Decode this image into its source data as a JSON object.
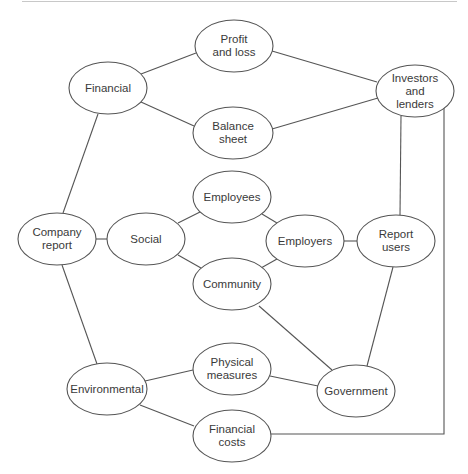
{
  "diagram": {
    "type": "concept-map",
    "colors": {
      "stroke": "#555555",
      "text": "#3a3a3a",
      "background": "#ffffff"
    },
    "nodes": [
      {
        "id": "financial",
        "label": "Financial",
        "cx": 108,
        "cy": 88,
        "rx": 39,
        "ry": 26
      },
      {
        "id": "profit-and-loss",
        "label": "Profit\nand loss",
        "cx": 234,
        "cy": 46,
        "rx": 39,
        "ry": 26
      },
      {
        "id": "balance-sheet",
        "label": "Balance\nsheet",
        "cx": 233,
        "cy": 133,
        "rx": 40,
        "ry": 26
      },
      {
        "id": "investors-and-lenders",
        "label": "Investors\nand\nlenders",
        "cx": 415,
        "cy": 91,
        "rx": 39,
        "ry": 26
      },
      {
        "id": "company-report",
        "label": "Company\nreport",
        "cx": 57,
        "cy": 239,
        "rx": 39,
        "ry": 26
      },
      {
        "id": "social",
        "label": "Social",
        "cx": 146,
        "cy": 239,
        "rx": 39,
        "ry": 26
      },
      {
        "id": "employees",
        "label": "Employees",
        "cx": 232,
        "cy": 197,
        "rx": 39,
        "ry": 26
      },
      {
        "id": "employers",
        "label": "Employers",
        "cx": 305,
        "cy": 241,
        "rx": 39,
        "ry": 26
      },
      {
        "id": "community",
        "label": "Community",
        "cx": 232,
        "cy": 284,
        "rx": 39,
        "ry": 26
      },
      {
        "id": "report-users",
        "label": "Report\nusers",
        "cx": 396,
        "cy": 241,
        "rx": 39,
        "ry": 26
      },
      {
        "id": "environmental",
        "label": "Environmental",
        "cx": 107,
        "cy": 389,
        "rx": 40,
        "ry": 26
      },
      {
        "id": "physical-measures",
        "label": "Physical\nmeasures",
        "cx": 232,
        "cy": 369,
        "rx": 39,
        "ry": 26
      },
      {
        "id": "government",
        "label": "Government",
        "cx": 356,
        "cy": 391,
        "rx": 39,
        "ry": 26
      },
      {
        "id": "financial-costs",
        "label": "Financial\ncosts",
        "cx": 232,
        "cy": 436,
        "rx": 39,
        "ry": 26
      }
    ],
    "edges": [
      {
        "from": "financial",
        "to": "profit-and-loss",
        "points": [
          [
            141,
            74
          ],
          [
            196,
            53
          ]
        ]
      },
      {
        "from": "financial",
        "to": "balance-sheet",
        "points": [
          [
            141,
            102
          ],
          [
            194,
            126
          ]
        ]
      },
      {
        "from": "profit-and-loss",
        "to": "investors-and-lenders",
        "points": [
          [
            272,
            51
          ],
          [
            377,
            82
          ]
        ]
      },
      {
        "from": "balance-sheet",
        "to": "investors-and-lenders",
        "points": [
          [
            272,
            129
          ],
          [
            378,
            98
          ]
        ]
      },
      {
        "from": "financial",
        "to": "company-report",
        "points": [
          [
            98,
            114
          ],
          [
            63,
            213
          ]
        ]
      },
      {
        "from": "company-report",
        "to": "social",
        "points": [
          [
            96,
            239
          ],
          [
            107,
            239
          ]
        ]
      },
      {
        "from": "social",
        "to": "employees",
        "points": [
          [
            178,
            223
          ],
          [
            200,
            212
          ]
        ]
      },
      {
        "from": "social",
        "to": "community",
        "points": [
          [
            178,
            255
          ],
          [
            201,
            268
          ]
        ]
      },
      {
        "from": "employees",
        "to": "employers",
        "points": [
          [
            262,
            214
          ],
          [
            277,
            223
          ]
        ]
      },
      {
        "from": "community",
        "to": "employers",
        "points": [
          [
            261,
            268
          ],
          [
            277,
            259
          ]
        ]
      },
      {
        "from": "employers",
        "to": "report-users",
        "points": [
          [
            344,
            241
          ],
          [
            357,
            241
          ]
        ]
      },
      {
        "from": "investors-and-lenders",
        "to": "report-users",
        "points": [
          [
            401,
            116
          ],
          [
            400,
            215
          ]
        ]
      },
      {
        "from": "report-users",
        "to": "government",
        "points": [
          [
            393,
            267
          ],
          [
            367,
            366
          ]
        ]
      },
      {
        "from": "community",
        "to": "government",
        "points": [
          [
            259,
            306
          ],
          [
            332,
            370
          ]
        ]
      },
      {
        "from": "company-report",
        "to": "environmental",
        "points": [
          [
            62,
            265
          ],
          [
            97,
            364
          ]
        ]
      },
      {
        "from": "environmental",
        "to": "physical-measures",
        "points": [
          [
            145,
            381
          ],
          [
            193,
            370
          ]
        ]
      },
      {
        "from": "physical-measures",
        "to": "government",
        "points": [
          [
            270,
            376
          ],
          [
            318,
            386
          ]
        ]
      },
      {
        "from": "environmental",
        "to": "financial-costs",
        "points": [
          [
            140,
            405
          ],
          [
            194,
            426
          ]
        ]
      },
      {
        "from": "investors-and-lenders",
        "to": "financial-costs",
        "points": [
          [
            444,
            107
          ],
          [
            444,
            434
          ],
          [
            271,
            434
          ]
        ]
      }
    ]
  }
}
